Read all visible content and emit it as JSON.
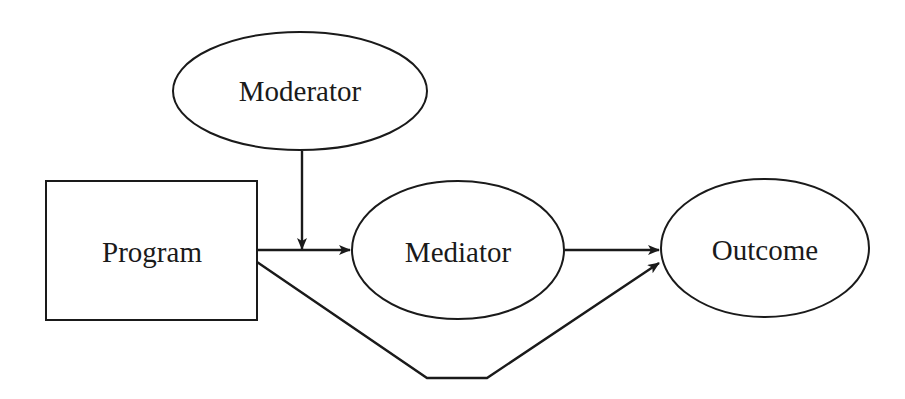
{
  "diagram": {
    "title": "",
    "nodes": [
      {
        "id": "moderator",
        "label": "Moderator",
        "shape": "ellipse"
      },
      {
        "id": "program",
        "label": "Program",
        "shape": "rectangle"
      },
      {
        "id": "mediator",
        "label": "Mediator",
        "shape": "ellipse"
      },
      {
        "id": "outcome",
        "label": "Outcome",
        "shape": "ellipse"
      }
    ],
    "edges": [
      {
        "from": "program",
        "to": "mediator",
        "label": ""
      },
      {
        "from": "moderator",
        "to": "program-mediator-edge",
        "label": ""
      },
      {
        "from": "mediator",
        "to": "outcome",
        "label": ""
      },
      {
        "from": "program",
        "to": "outcome",
        "label": "",
        "routing": "below"
      }
    ],
    "colors": {
      "stroke": "#1a1a1a",
      "background": "#ffffff"
    }
  }
}
